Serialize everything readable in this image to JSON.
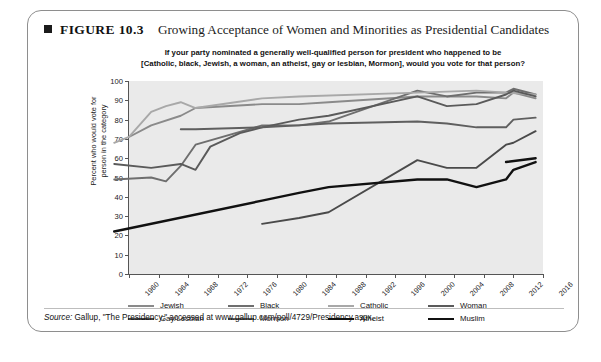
{
  "figure": {
    "number": "FIGURE 10.3",
    "title": "Growing Acceptance of Women and Minorities as Presidential Candidates",
    "question_line1": "If your party nominated a generally well-qualified person for president who happened to be",
    "question_line2": "[Catholic, black, Jewish, a woman, an atheist, gay or lesbian, Mormon], would you vote for that person?",
    "source_prefix": "Source:",
    "source_text": " Gallup, \"The Presidency,\" accessed at www.gallup.com/poll/4729/Presidency.aspx."
  },
  "chart_data": {
    "type": "line",
    "title": "Growing Acceptance of Women and Minorities as Presidential Candidates",
    "xlabel": "",
    "ylabel": "Percent who would vote for person in the category",
    "xlim": [
      1960,
      2016
    ],
    "ylim": [
      0,
      100
    ],
    "grid": "horizontal-bands",
    "legend_position": "bottom",
    "ytick_labels": [
      "0",
      "10",
      "20",
      "30",
      "40",
      "50",
      "60",
      "70",
      "80",
      "90",
      "100"
    ],
    "ytick_values": [
      0,
      10,
      20,
      30,
      40,
      50,
      60,
      70,
      80,
      90,
      100
    ],
    "xtick_labels": [
      "1960",
      "1964",
      "1968",
      "1972",
      "1976",
      "1980",
      "1984",
      "1988",
      "1992",
      "1996",
      "2000",
      "2004",
      "2008",
      "2012",
      "2016"
    ],
    "xtick_values": [
      1960,
      1964,
      1968,
      1972,
      1976,
      1980,
      1984,
      1988,
      1992,
      1996,
      2000,
      2004,
      2008,
      2012,
      2016
    ],
    "series": [
      {
        "name": "Jewish",
        "color": "#8a8a8a",
        "width": 1.9,
        "x": [
          1960,
          1963,
          1967,
          1969,
          1978,
          1983,
          1987,
          1999,
          2003,
          2007,
          2011,
          2012,
          2015
        ],
        "values": [
          71,
          77,
          82,
          86,
          88,
          88,
          89,
          92,
          92,
          92,
          91,
          94,
          91
        ]
      },
      {
        "name": "Black",
        "color": "#6e6e6e",
        "width": 1.9,
        "x": [
          1958,
          1963,
          1965,
          1967,
          1969,
          1978,
          1983,
          1987,
          1999,
          2003,
          2007,
          2011,
          2012,
          2015
        ],
        "values": [
          49,
          50,
          48,
          56,
          67,
          77,
          77,
          79,
          95,
          92,
          94,
          94,
          96,
          93
        ]
      },
      {
        "name": "Catholic",
        "color": "#a8a8a8",
        "width": 1.9,
        "x": [
          1958,
          1960,
          1963,
          1965,
          1967,
          1969,
          1978,
          1983,
          1999,
          2007,
          2011,
          2015
        ],
        "values": [
          68,
          71,
          84,
          87,
          89,
          86,
          91,
          92,
          94,
          95,
          94,
          93
        ]
      },
      {
        "name": "Woman",
        "color": "#5a5a5a",
        "width": 1.9,
        "x": [
          1958,
          1963,
          1967,
          1969,
          1971,
          1975,
          1978,
          1983,
          1987,
          1999,
          2003,
          2007,
          2011,
          2012,
          2015
        ],
        "values": [
          57,
          55,
          57,
          54,
          66,
          73,
          76,
          80,
          82,
          92,
          87,
          88,
          93,
          95,
          92
        ]
      },
      {
        "name": "Gay/Lesbian",
        "color": "#4a4a4a",
        "width": 1.9,
        "x": [
          1978,
          1983,
          1987,
          1999,
          2003,
          2007,
          2011,
          2012,
          2015
        ],
        "values": [
          26,
          29,
          32,
          59,
          55,
          55,
          67,
          68,
          74
        ]
      },
      {
        "name": "Mormon",
        "color": "#5f5f5f",
        "width": 1.9,
        "x": [
          1967,
          1969,
          1978,
          1983,
          1987,
          1999,
          2003,
          2007,
          2011,
          2012,
          2015
        ],
        "values": [
          75,
          75,
          76,
          77,
          78,
          79,
          78,
          76,
          76,
          80,
          81
        ]
      },
      {
        "name": "Atheist",
        "color": "#111111",
        "width": 2.4,
        "x": [
          1958,
          1978,
          1983,
          1987,
          1999,
          2003,
          2007,
          2011,
          2012,
          2015
        ],
        "values": [
          22,
          38,
          42,
          45,
          49,
          49,
          45,
          49,
          54,
          58
        ]
      },
      {
        "name": "Muslim",
        "color": "#111111",
        "width": 2.4,
        "x": [
          2011,
          2015
        ],
        "values": [
          58,
          60
        ]
      }
    ]
  },
  "legend": {
    "items": [
      {
        "label": "Jewish",
        "color": "#8a8a8a",
        "width": 2.0
      },
      {
        "label": "Black",
        "color": "#6e6e6e",
        "width": 2.0
      },
      {
        "label": "Catholic",
        "color": "#a8a8a8",
        "width": 2.0
      },
      {
        "label": "Woman",
        "color": "#5a5a5a",
        "width": 2.4
      },
      {
        "label": "Gay/Lesbian",
        "color": "#4a4a4a",
        "width": 2.4
      },
      {
        "label": "Mormon",
        "color": "#5f5f5f",
        "width": 2.2
      },
      {
        "label": "Atheist",
        "color": "#111111",
        "width": 2.6
      },
      {
        "label": "Muslim",
        "color": "#111111",
        "width": 2.6
      }
    ]
  }
}
